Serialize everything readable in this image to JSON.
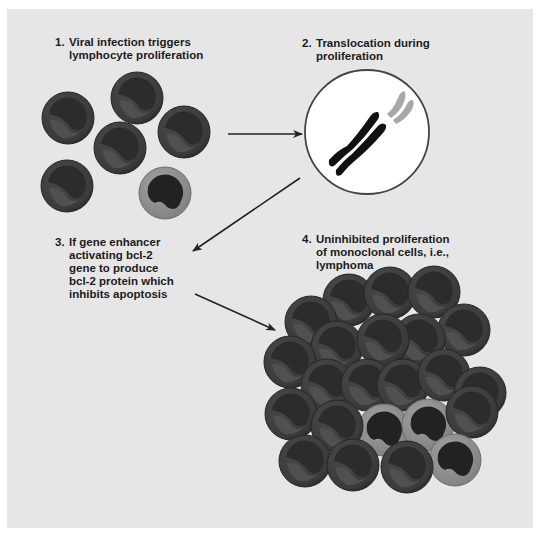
{
  "diagram": {
    "colors": {
      "panel_bg": "#e6e6e6",
      "cell_dark_outer": "#3d3d3d",
      "cell_dark_inner": "#2b2b2b",
      "cell_light_outer": "#8e8e8e",
      "cell_nucleus": "#222222",
      "chromosome": "#111111",
      "chromosome_fragment": "#a8a8a8",
      "arrow": "#222222",
      "text": "#1c1c1c"
    },
    "steps": [
      {
        "number": "1.",
        "lines": [
          "Viral infection triggers",
          "lymphocyte proliferation"
        ]
      },
      {
        "number": "2.",
        "lines": [
          "Translocation during",
          "proliferation"
        ]
      },
      {
        "number": "3.",
        "lines": [
          "If gene enhancer",
          "activating bcl-2",
          "gene to produce",
          "bcl-2 protein which",
          "inhibits apoptosis"
        ]
      },
      {
        "number": "4.",
        "lines": [
          "Uninhibited proliferation",
          "of monoclonal cells, i.e.,",
          "lymphoma"
        ]
      }
    ],
    "arrows": [
      {
        "from": "step-1",
        "to": "step-2"
      },
      {
        "from": "step-2",
        "to": "step-3"
      },
      {
        "from": "step-3",
        "to": "step-4"
      }
    ],
    "groups": {
      "polyclonal_cells": {
        "dark_count": 5,
        "light_count": 1
      },
      "nucleus_with_chromosome": {
        "chromosome_count": 1,
        "fragment": "translocated segment"
      },
      "monoclonal_cluster": {
        "dark_count": 19,
        "light_count": 3
      }
    }
  }
}
